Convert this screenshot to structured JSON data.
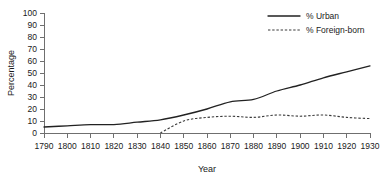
{
  "chart_data": {
    "type": "line",
    "title": "",
    "xlabel": "Year",
    "ylabel": "Percentage",
    "xlim": [
      1790,
      1930
    ],
    "ylim": [
      0,
      100
    ],
    "grid": false,
    "legend_position": "top-right",
    "xticks": [
      1790,
      1800,
      1810,
      1820,
      1830,
      1840,
      1850,
      1860,
      1870,
      1880,
      1890,
      1900,
      1910,
      1920,
      1930
    ],
    "yticks": [
      0,
      10,
      20,
      30,
      40,
      50,
      60,
      70,
      80,
      90,
      100
    ],
    "x": [
      1790,
      1800,
      1810,
      1820,
      1830,
      1840,
      1850,
      1860,
      1870,
      1880,
      1890,
      1900,
      1910,
      1920,
      1930
    ],
    "series": [
      {
        "name": "% Urban",
        "style": "solid",
        "color": "#222222",
        "x": [
          1790,
          1800,
          1810,
          1820,
          1830,
          1840,
          1850,
          1860,
          1870,
          1880,
          1890,
          1900,
          1910,
          1920,
          1930
        ],
        "values": [
          5,
          6,
          7,
          7,
          9,
          11,
          15,
          20,
          26,
          28,
          35,
          40,
          46,
          51,
          56
        ]
      },
      {
        "name": "% Foreign-born",
        "style": "dashed",
        "color": "#3a3a3a",
        "x": [
          1840,
          1850,
          1860,
          1870,
          1880,
          1890,
          1900,
          1910,
          1920,
          1930
        ],
        "values": [
          0,
          10,
          13,
          14,
          13,
          15,
          14,
          15,
          13,
          12
        ]
      }
    ]
  },
  "axes": {
    "y_title": "Percentage",
    "x_title": "Year"
  },
  "legend": {
    "entries": [
      {
        "label": "% Urban",
        "style": "solid"
      },
      {
        "label": "% Foreign-born",
        "style": "dashed"
      }
    ]
  }
}
